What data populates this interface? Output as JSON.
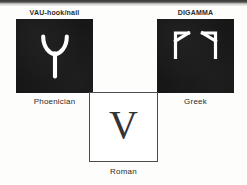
{
  "figure": {
    "type": "letter-evolution-diagram",
    "background_color": "#fdfdfc",
    "panel_color": "#171717",
    "glyph_color": "#ffffff",
    "roman_letter_color": "#333333"
  },
  "phoenician": {
    "top_label": "VAU-hook/nail",
    "bottom_label": "Phoenician",
    "glyph_name": "phoenician-vau-glyph",
    "glyph_description": "white Y-shaped hook with curved arms"
  },
  "greek": {
    "top_label": "DIGAMMA",
    "bottom_label": "Greek",
    "glyph_name": "greek-digamma-glyph",
    "glyph_count": 2,
    "glyph_description": "two white arrow-like digamma forms, mirrored"
  },
  "roman": {
    "letter": "V",
    "bottom_label": "Roman",
    "glyph_name": "roman-v-letter"
  }
}
